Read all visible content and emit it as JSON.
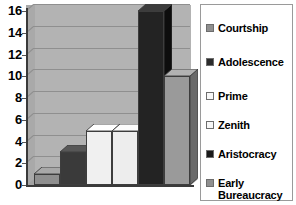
{
  "chart_data": {
    "type": "bar",
    "title": "",
    "xlabel": "",
    "ylabel": "",
    "categories": [
      "Courtship",
      "Adolescence",
      "Prime",
      "Zenith",
      "Aristocracy",
      "Early Bureaucracy"
    ],
    "values": [
      1,
      3,
      5,
      5,
      16,
      10
    ],
    "ylim": [
      0,
      16
    ],
    "yticks": [
      0,
      2,
      4,
      6,
      8,
      10,
      12,
      14,
      16
    ],
    "ytick_labels": [
      "0",
      "2",
      "4",
      "6",
      "8",
      "10",
      "12",
      "14",
      "16"
    ],
    "grid": true,
    "grid_axis": "y",
    "legend_position": "right",
    "style": "3d-column",
    "plot_background": "#b3b3b3",
    "series": [
      {
        "name": "Courtship",
        "value": 1,
        "color": "#8f8f8f",
        "top_color": "#a8a8a8",
        "side_color": "#6e6e6e"
      },
      {
        "name": "Adolescence",
        "value": 3,
        "color": "#3a3a3a",
        "top_color": "#575757",
        "side_color": "#1f1f1f"
      },
      {
        "name": "Prime",
        "value": 5,
        "color": "#f0f0f0",
        "top_color": "#ffffff",
        "side_color": "#d0d0d0"
      },
      {
        "name": "Zenith",
        "value": 5,
        "color": "#ededed",
        "top_color": "#fcfcfc",
        "side_color": "#cccccc"
      },
      {
        "name": "Aristocracy",
        "value": 16,
        "color": "#232323",
        "top_color": "#3c3c3c",
        "side_color": "#0d0d0d"
      },
      {
        "name": "Early Bureaucracy",
        "value": 10,
        "color": "#9a9a9a",
        "top_color": "#b2b2b2",
        "side_color": "#6a6a6a"
      }
    ]
  },
  "legend": {
    "items": [
      {
        "label": "Courtship",
        "swatch": "#8f8f8f"
      },
      {
        "label": "Adolescence",
        "swatch": "#2b2b2b"
      },
      {
        "label": "Prime",
        "swatch": "#f7f7f7"
      },
      {
        "label": "Zenith",
        "swatch": "#f7f7f7"
      },
      {
        "label": "Aristocracy",
        "swatch": "#1a1a1a"
      },
      {
        "label": "Early\nBureaucracy",
        "swatch": "#8f8f8f"
      }
    ]
  },
  "axis": {
    "y_labels": [
      "16",
      "14",
      "12",
      "10",
      "8",
      "6",
      "4",
      "2",
      "0"
    ]
  },
  "colors": {
    "plot_bg": "#b3b3b3",
    "gridline": "#8f8f8f",
    "axis": "#3a3a3a",
    "legend_border": "#9a9a9a",
    "page_bg": "#ffffff"
  }
}
